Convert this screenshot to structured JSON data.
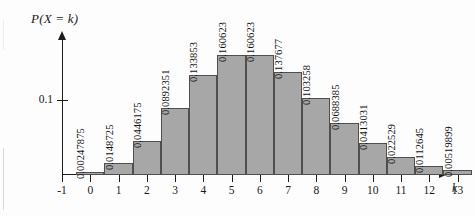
{
  "chart_data": {
    "type": "bar",
    "title": "P(X = k)",
    "xlabel": "k",
    "ylabel": "P(X = k)",
    "categories": [
      "0",
      "1",
      "2",
      "3",
      "4",
      "5",
      "6",
      "7",
      "8",
      "9",
      "10",
      "11",
      "12",
      "13"
    ],
    "values": [
      0.00247875,
      0.0148725,
      0.0446175,
      0.0892351,
      0.133853,
      0.160623,
      0.160623,
      0.137677,
      0.103258,
      0.0688385,
      0.0413031,
      0.022529,
      0.0112645,
      0.00519899
    ],
    "value_labels": [
      "0.00247875",
      "0.0148725",
      "0.0446175",
      "0.0892351",
      "0.133853",
      "0.160623",
      "0.160623",
      "0.137677",
      "0.103258",
      "0.0688385",
      "0.0413031",
      "0.022529",
      "0.0112645",
      "0.00519899"
    ],
    "xtick_labels": [
      "-1",
      "0",
      "1",
      "2",
      "3",
      "4",
      "5",
      "6",
      "7",
      "8",
      "9",
      "10",
      "11",
      "12",
      "13"
    ],
    "ytick_labels": [
      "0.1"
    ],
    "ytick_values": [
      0.1
    ],
    "xlim": [
      -1.5,
      13.6
    ],
    "ylim": [
      0,
      0.1855
    ],
    "grid": false,
    "legend": null,
    "bar_fill_color": "#a7a7a7",
    "bar_edge_color": "#4f4f4f",
    "axis_color": "#1c1c1c"
  }
}
